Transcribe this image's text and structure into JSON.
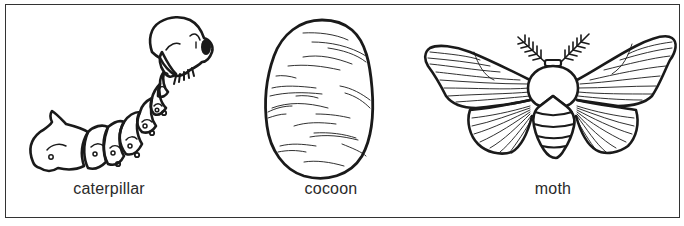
{
  "diagram": {
    "type": "life-cycle",
    "stages": [
      {
        "id": "caterpillar",
        "label": "caterpillar",
        "center_x": 109
      },
      {
        "id": "cocoon",
        "label": "cocoon",
        "center_x": 331
      },
      {
        "id": "moth",
        "label": "moth",
        "center_x": 553
      }
    ]
  },
  "colors": {
    "line": "#1a1a1a",
    "label": "#2a2a2a",
    "border": "#333333",
    "background": "#ffffff"
  }
}
